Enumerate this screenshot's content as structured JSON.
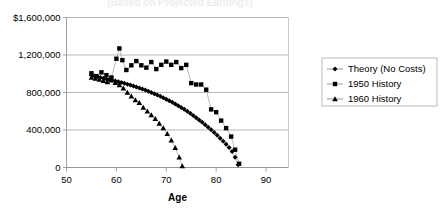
{
  "chart_data": {
    "type": "line",
    "title": "",
    "subtitle": "",
    "xlabel": "Age",
    "ylabel": "",
    "xlim": [
      50,
      94.5
    ],
    "ylim": [
      0,
      1600000
    ],
    "grid": true,
    "legend_position": "right",
    "x_ticks": [
      50,
      60,
      70,
      80,
      90
    ],
    "x_tick_labels": [
      "50",
      "60",
      "70",
      "80",
      "90"
    ],
    "y_ticks": [
      0,
      400000,
      800000,
      1200000,
      1600000
    ],
    "y_tick_labels": [
      "0",
      "400,000",
      "800,000",
      "1,200,000",
      "$1,600,000"
    ],
    "series": [
      {
        "name": "Theory (No Costs)",
        "marker": "diamond",
        "color": "#000000",
        "x": [
          55,
          55.6,
          56.2,
          56.8,
          57.4,
          58,
          58.6,
          59.2,
          59.8,
          60.4,
          61,
          61.6,
          62.2,
          62.8,
          63.4,
          64,
          64.6,
          65.2,
          65.8,
          66.4,
          67,
          67.6,
          68.2,
          68.8,
          69.4,
          70,
          70.6,
          71.2,
          71.8,
          72.4,
          73,
          73.6,
          74.2,
          74.8,
          75.4,
          76,
          76.6,
          77.2,
          77.8,
          78.4,
          79,
          79.6,
          80.2,
          80.8,
          81.4,
          82,
          82.6,
          83.2,
          83.8,
          84.4
        ],
        "y": [
          985000,
          975000,
          968000,
          960000,
          952000,
          945000,
          938000,
          930000,
          922000,
          915000,
          906000,
          898000,
          889000,
          880000,
          870000,
          860000,
          849000,
          838000,
          826000,
          814000,
          801000,
          788000,
          774000,
          760000,
          745000,
          729000,
          713000,
          696000,
          678000,
          660000,
          641000,
          621000,
          600000,
          578000,
          556000,
          532000,
          508000,
          483000,
          457000,
          430000,
          402000,
          373000,
          343000,
          312000,
          280000,
          247000,
          213000,
          170000,
          110000,
          30000
        ]
      },
      {
        "name": "1950 History",
        "marker": "square",
        "color": "#000000",
        "x": [
          55,
          56,
          57,
          58,
          59,
          60,
          60.6,
          61.2,
          62,
          63,
          64,
          65,
          66,
          67,
          68,
          69,
          70,
          71,
          72,
          73,
          74,
          75,
          76,
          77,
          78,
          79,
          80,
          81,
          82,
          83,
          83.8,
          84.6
        ],
        "y": [
          1005000,
          975000,
          1015000,
          985000,
          960000,
          1160000,
          1270000,
          1145000,
          1040000,
          1090000,
          1135000,
          1090000,
          1065000,
          1125000,
          1050000,
          1095000,
          1130000,
          1095000,
          1125000,
          1060000,
          1095000,
          900000,
          885000,
          885000,
          830000,
          620000,
          590000,
          500000,
          420000,
          330000,
          190000,
          40000
        ]
      },
      {
        "name": "1960 History",
        "marker": "triangle",
        "color": "#000000",
        "x": [
          55,
          55.8,
          56.6,
          57.4,
          58.2,
          59,
          59.8,
          60.6,
          61.4,
          62.2,
          63,
          63.8,
          64.6,
          65.4,
          66.2,
          67,
          67.8,
          68.6,
          69.4,
          70.2,
          71,
          71.8,
          72.6,
          73.2
        ],
        "y": [
          960000,
          950000,
          938000,
          926000,
          912000,
          930000,
          905000,
          880000,
          845000,
          800000,
          760000,
          720000,
          690000,
          640000,
          600000,
          560000,
          520000,
          470000,
          420000,
          360000,
          290000,
          210000,
          110000,
          15000
        ]
      }
    ]
  }
}
